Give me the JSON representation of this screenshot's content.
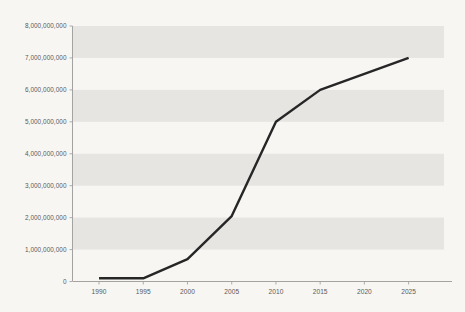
{
  "chart_data": {
    "type": "line",
    "title": "",
    "subtitle": "",
    "xlabel": "",
    "ylabel": "",
    "x": [
      1990,
      1995,
      2000,
      2005,
      2010,
      2015,
      2025
    ],
    "series": [
      {
        "name": "series-1",
        "values": [
          100000000,
          100000000,
          700000000,
          2050000000,
          5000000000,
          6000000000,
          7000000000
        ]
      }
    ],
    "xlim": [
      1987,
      2029
    ],
    "ylim": [
      0,
      8000000000
    ],
    "xticks": [
      1990,
      1995,
      2000,
      2005,
      2010,
      2015,
      2020,
      2025
    ],
    "xtick_labels": [
      "1990",
      "1995",
      "2000",
      "2005",
      "2010",
      "2015",
      "2020",
      "2025"
    ],
    "yticks": [
      0,
      1000000000,
      2000000000,
      3000000000,
      4000000000,
      5000000000,
      6000000000,
      7000000000,
      8000000000
    ],
    "ytick_labels": [
      "0",
      "1,000,000,000",
      "2,000,000,000",
      "3,000,000,000",
      "4,000,000,000",
      "5,000,000,000",
      "6,000,000,000",
      "7,000,000,000",
      "8,000,000,000"
    ],
    "grid": false,
    "banded_background": true,
    "band_intervals": [
      [
        7000000000,
        8000000000
      ],
      [
        5000000000,
        6000000000
      ],
      [
        3000000000,
        4000000000
      ],
      [
        1000000000,
        2000000000
      ]
    ],
    "legend": [],
    "legend_position": "none",
    "annotations": [],
    "colors": {
      "background": "#f7f6f3",
      "band": "#e6e5e2",
      "line": "#262626",
      "axis": "#9a9a98",
      "tick_label": "#5a5a58"
    }
  }
}
